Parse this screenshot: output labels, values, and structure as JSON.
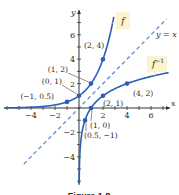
{
  "chart_data": {
    "type": "line",
    "title": "",
    "caption": "Figure 1.8",
    "xlabel": "x",
    "ylabel": "y",
    "xlim": [
      -5,
      7.5
    ],
    "ylim": [
      -5.5,
      8
    ],
    "x_ticks": [
      -4,
      -2,
      2,
      4,
      6
    ],
    "y_ticks": [
      -4,
      -2,
      2,
      4,
      6
    ],
    "x_tick_labels": [
      "-4",
      "-2",
      "2",
      "4",
      "6"
    ],
    "y_tick_labels": [
      "-4",
      "-2",
      "2",
      "4",
      "6"
    ],
    "grid": false,
    "series": [
      {
        "name": "f",
        "label": "f",
        "function": "2^x",
        "color": "#2a5fb8",
        "style": "solid",
        "points": [
          {
            "x": -1,
            "y": 0.5,
            "label": "(-1, 0.5)"
          },
          {
            "x": 0,
            "y": 1,
            "label": "(0, 1)"
          },
          {
            "x": 1,
            "y": 2,
            "label": "(1, 2)"
          },
          {
            "x": 2,
            "y": 4,
            "label": "(2, 4)"
          }
        ]
      },
      {
        "name": "f^-1",
        "label": "f",
        "label_sup": "-1",
        "function": "log2(x)",
        "color": "#2a5fb8",
        "style": "solid",
        "points": [
          {
            "x": 0.5,
            "y": -1,
            "label": "(0.5, -1)"
          },
          {
            "x": 1,
            "y": 0,
            "label": "(1, 0)"
          },
          {
            "x": 2,
            "y": 1,
            "label": "(2, 1)"
          },
          {
            "x": 4,
            "y": 2,
            "label": "(4, 2)"
          }
        ]
      },
      {
        "name": "y = x",
        "label": "y = x",
        "function": "x",
        "color": "#5b8fd6",
        "style": "dashed"
      }
    ],
    "callout_color": "#fdf3cc"
  }
}
